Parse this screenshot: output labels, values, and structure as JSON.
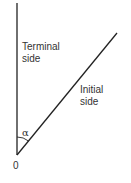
{
  "diagram": {
    "terminal_label_line1": "Terminal",
    "terminal_label_line2": "side",
    "initial_label_line1": "Initial",
    "initial_label_line2": "side",
    "angle_label": "α",
    "origin_label": "0",
    "line_color": "#222222"
  }
}
